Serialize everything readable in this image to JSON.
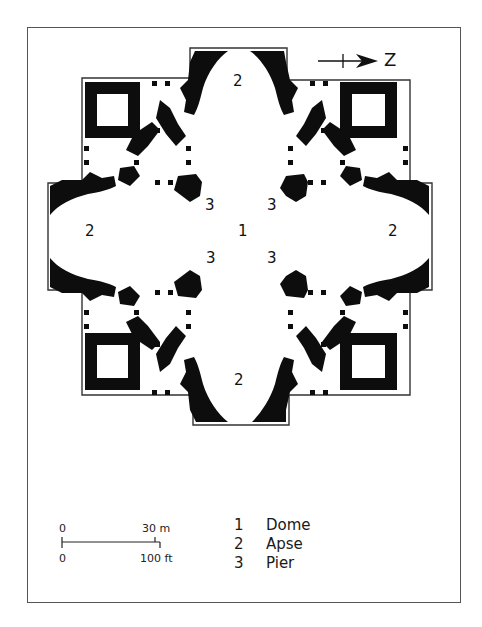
{
  "figure": {
    "type": "architectural floor plan",
    "orientation": {
      "north_arrow_label": "Z"
    },
    "plan_labels": [
      {
        "id": "dome-center",
        "text": "1",
        "x": 238,
        "y": 224
      },
      {
        "id": "apse-top",
        "text": "2",
        "x": 233,
        "y": 74
      },
      {
        "id": "apse-left",
        "text": "2",
        "x": 85,
        "y": 224
      },
      {
        "id": "apse-right",
        "text": "2",
        "x": 388,
        "y": 224
      },
      {
        "id": "apse-bottom",
        "text": "2",
        "x": 234,
        "y": 373
      },
      {
        "id": "pier-top-left",
        "text": "3",
        "x": 205,
        "y": 198
      },
      {
        "id": "pier-top-right",
        "text": "3",
        "x": 267,
        "y": 198
      },
      {
        "id": "pier-bottom-left",
        "text": "3",
        "x": 206,
        "y": 251
      },
      {
        "id": "pier-bottom-right",
        "text": "3",
        "x": 267,
        "y": 251
      }
    ]
  },
  "scale_bar": {
    "top_left": "0",
    "top_right": "30 m",
    "bottom_left": "0",
    "bottom_right": "100 ft"
  },
  "legend": {
    "items": [
      {
        "number": "1",
        "label": "Dome"
      },
      {
        "number": "2",
        "label": "Apse"
      },
      {
        "number": "3",
        "label": "Pier"
      }
    ]
  },
  "colors": {
    "wall": "#0d0d0d",
    "outline": "#333333",
    "frame": "#555555",
    "background": "#ffffff"
  }
}
